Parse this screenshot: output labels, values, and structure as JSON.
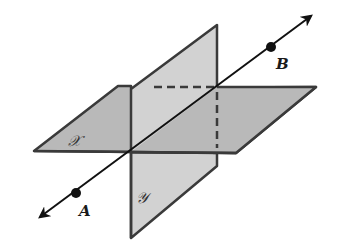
{
  "diagram": {
    "title": "",
    "colors": {
      "plane_fill_horizontal": "#b9b9b9",
      "plane_fill_vertical": "#d2d2d2",
      "plane_edge": "#3a3a3a",
      "line": "#111111",
      "background": "#ffffff"
    },
    "planes": [
      {
        "id": "X",
        "label": "𝒳",
        "orientation": "horizontal"
      },
      {
        "id": "Y",
        "label": "𝒴",
        "orientation": "vertical"
      }
    ],
    "line": {
      "description": "line through points A and B, intersecting both planes at the intersection line",
      "arrows": "both ends"
    },
    "points": [
      {
        "id": "A",
        "label": "A"
      },
      {
        "id": "B",
        "label": "B"
      }
    ],
    "hidden_edges": "dashed"
  }
}
